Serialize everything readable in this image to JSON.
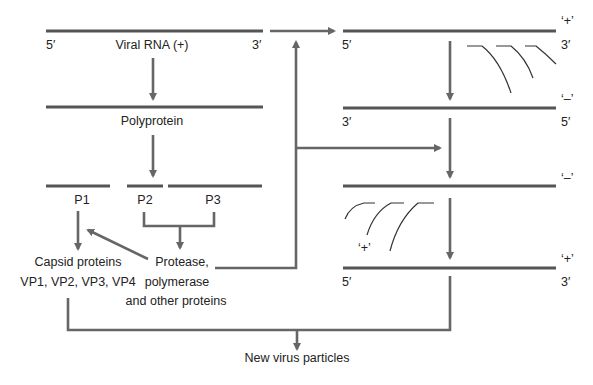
{
  "colors": {
    "strand": "#555555",
    "arrow": "#666666",
    "text": "#222222",
    "background": "#ffffff"
  },
  "translation": {
    "viral_rna": {
      "label": "Viral RNA (+)",
      "end5": "5′",
      "end3": "3′"
    },
    "polyprotein": {
      "label": "Polyprotein"
    },
    "fragments": [
      {
        "label": "P1"
      },
      {
        "label": "P2"
      },
      {
        "label": "P3"
      }
    ],
    "capsid": {
      "line1": "Capsid proteins",
      "line2": "VP1, VP2, VP3, VP4"
    },
    "nonstructural": {
      "line1": "Protease,",
      "line2": "polymerase",
      "line3": "and other proteins"
    }
  },
  "replication": {
    "strand1": {
      "sense": "‘+’",
      "left": "5′",
      "right": "3′"
    },
    "strand2": {
      "sense": "‘–’",
      "left": "3′",
      "right": "5′"
    },
    "strand3": {
      "sense": "‘–’"
    },
    "nascent_label": "‘+’",
    "strand4": {
      "sense": "‘+’",
      "left": "5′",
      "right": "3′"
    }
  },
  "output": {
    "label": "New virus particles"
  }
}
